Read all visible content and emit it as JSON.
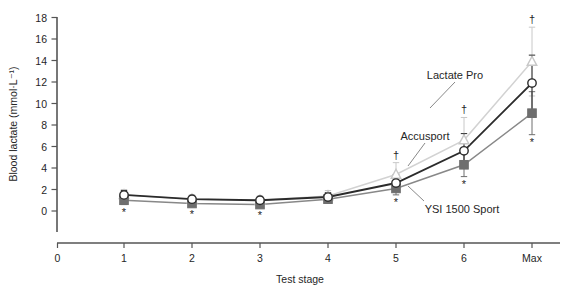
{
  "chart_data": {
    "type": "line",
    "title": "",
    "xlabel": "Test stage",
    "ylabel": "Blood lactate (mmol·L⁻¹)",
    "categories": [
      "1",
      "2",
      "3",
      "4",
      "5",
      "6",
      "Max"
    ],
    "xticks": [
      "0",
      "1",
      "2",
      "3",
      "4",
      "5",
      "6",
      "Max"
    ],
    "yticks": [
      "0",
      "2",
      "4",
      "6",
      "8",
      "10",
      "12",
      "14",
      "16",
      "18"
    ],
    "ylim": [
      0,
      18
    ],
    "grid": false,
    "legend_position": "inline-annotations",
    "series": [
      {
        "name": "Lactate Pro",
        "marker": "open-triangle",
        "color": "#c8c8c8",
        "line_color": "#d2d2d2",
        "values": [
          1.5,
          1.1,
          1.0,
          1.4,
          3.4,
          6.6,
          13.9
        ],
        "err_low": [
          0.5,
          0.4,
          0.4,
          0.5,
          1.1,
          2.1,
          3.2
        ],
        "err_high": [
          0.5,
          0.4,
          0.4,
          0.5,
          1.1,
          2.1,
          3.2
        ],
        "annotations": [
          "",
          "",
          "",
          "",
          "†",
          "†",
          "†"
        ]
      },
      {
        "name": "Accusport",
        "marker": "open-circle",
        "color": "#2b2b2b",
        "line_color": "#2b2b2b",
        "values": [
          1.5,
          1.1,
          1.0,
          1.3,
          2.6,
          5.6,
          11.9
        ],
        "err_low": [
          0.4,
          0.3,
          0.3,
          0.4,
          0.8,
          1.6,
          2.6
        ],
        "err_high": [
          0.4,
          0.3,
          0.3,
          0.4,
          0.8,
          1.6,
          2.6
        ],
        "annotations": [
          "",
          "",
          "",
          "",
          "",
          "",
          ""
        ]
      },
      {
        "name": "YSI 1500 Sport",
        "marker": "filled-square",
        "color": "#6e6e6e",
        "line_color": "#888888",
        "values": [
          1.0,
          0.7,
          0.6,
          1.1,
          2.1,
          4.3,
          9.1
        ],
        "err_low": [
          0.4,
          0.3,
          0.3,
          0.3,
          0.6,
          1.1,
          2.0
        ],
        "err_high": [
          0.4,
          0.3,
          0.3,
          0.3,
          0.6,
          1.1,
          2.0
        ],
        "annotations": [
          "*",
          "*",
          "*",
          "",
          "*",
          "*",
          "*"
        ]
      }
    ],
    "annotations_text": [
      {
        "label": "Lactate Pro",
        "x": 455,
        "y": 76
      },
      {
        "label": "Accusport",
        "x": 425,
        "y": 137
      },
      {
        "label": "YSI 1500 Sport",
        "x": 462,
        "y": 210
      }
    ],
    "colors": {
      "axis": "#555555",
      "text": "#262626",
      "lactate_pro": "#c8c8c8",
      "accusport": "#2b2b2b",
      "ysi": "#808080"
    }
  }
}
